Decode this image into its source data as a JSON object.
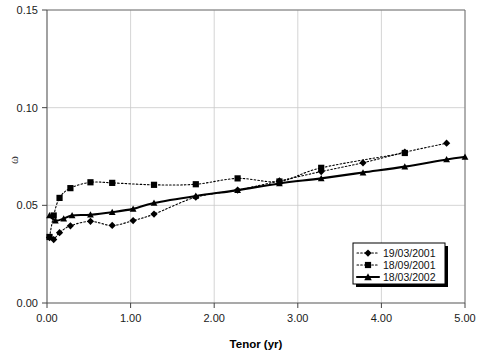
{
  "chart_data": {
    "type": "line",
    "title": "",
    "xlabel": "Tenor (yr)",
    "ylabel": "ω",
    "xlim": [
      0.0,
      5.0
    ],
    "ylim": [
      0.0,
      0.15
    ],
    "xticks": [
      "0.00",
      "1.00",
      "2.00",
      "3.00",
      "4.00",
      "5.00"
    ],
    "xtick_values": [
      0.0,
      1.0,
      2.0,
      3.0,
      4.0,
      5.0
    ],
    "yticks": [
      "0.00",
      "0.05",
      "0.10",
      "0.15"
    ],
    "ytick_values": [
      0.0,
      0.05,
      0.1,
      0.15
    ],
    "grid": true,
    "legend_position": "lower-right",
    "series": [
      {
        "name": "19/03/2001",
        "marker": "diamond",
        "linestyle": "dotted",
        "x": [
          0.03,
          0.08,
          0.15,
          0.28,
          0.52,
          0.78,
          1.03,
          1.28,
          1.78,
          2.28,
          2.78,
          3.28,
          3.78,
          4.28,
          4.78
        ],
        "y": [
          0.0335,
          0.0325,
          0.036,
          0.0395,
          0.0418,
          0.0397,
          0.0422,
          0.0455,
          0.0542,
          0.0578,
          0.0625,
          0.0673,
          0.0718,
          0.0772,
          0.0818
        ]
      },
      {
        "name": "18/09/2001",
        "marker": "square",
        "linestyle": "dotted",
        "x": [
          0.03,
          0.08,
          0.15,
          0.28,
          0.52,
          0.78,
          1.28,
          1.78,
          2.28,
          2.78,
          3.28,
          4.28
        ],
        "y": [
          0.0338,
          0.0448,
          0.0538,
          0.0588,
          0.0618,
          0.0615,
          0.0605,
          0.0608,
          0.0638,
          0.0622,
          0.0692,
          0.0768
        ]
      },
      {
        "name": "18/03/2002",
        "marker": "triangle",
        "linestyle": "solid",
        "x": [
          0.03,
          0.1,
          0.2,
          0.3,
          0.52,
          0.78,
          1.03,
          1.28,
          1.78,
          2.28,
          2.78,
          3.28,
          3.78,
          4.28,
          4.78,
          5.0
        ],
        "y": [
          0.0448,
          0.0422,
          0.0432,
          0.0448,
          0.0452,
          0.0465,
          0.0482,
          0.0512,
          0.0548,
          0.0578,
          0.0612,
          0.0638,
          0.0668,
          0.0698,
          0.0735,
          0.0748
        ]
      }
    ]
  },
  "legend": {
    "items": [
      {
        "label": "19/03/2001",
        "marker": "diamond",
        "linestyle": "dotted"
      },
      {
        "label": "18/09/2001",
        "marker": "square",
        "linestyle": "dotted"
      },
      {
        "label": "18/03/2002",
        "marker": "triangle",
        "linestyle": "solid"
      }
    ]
  },
  "colors": {
    "line": "#000000",
    "grid": "#c9c9c9",
    "axis": "#555555",
    "background": "#ffffff"
  }
}
